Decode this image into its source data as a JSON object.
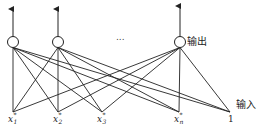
{
  "diagram": {
    "title": "",
    "output_label": "输出",
    "input_label": "输入",
    "ellipsis": "...",
    "output_nodes": [
      {
        "id": "o1",
        "x": 13,
        "y": 42
      },
      {
        "id": "o2",
        "x": 58,
        "y": 42
      },
      {
        "id": "o3",
        "x": 180,
        "y": 42
      }
    ],
    "inputs": [
      {
        "id": "x1",
        "x": 13,
        "y": 112,
        "base": "x",
        "sub": "1",
        "sup": "*"
      },
      {
        "id": "x2",
        "x": 58,
        "y": 112,
        "base": "x",
        "sub": "2",
        "sup": "*"
      },
      {
        "id": "x3",
        "x": 102,
        "y": 112,
        "base": "x",
        "sub": "3",
        "sup": "*"
      },
      {
        "id": "xn",
        "x": 179,
        "y": 112,
        "base": "x",
        "sub": "n",
        "sup": "*"
      },
      {
        "id": "bias",
        "x": 230,
        "y": 112,
        "text": "1"
      }
    ],
    "colors": {
      "stroke": "#222222",
      "background": "#ffffff"
    }
  }
}
